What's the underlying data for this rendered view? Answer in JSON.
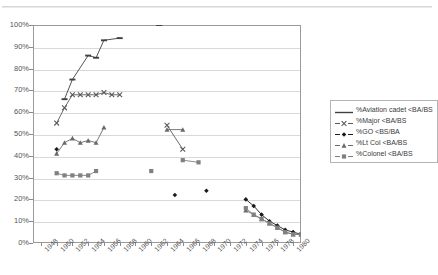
{
  "chart_data": {
    "type": "line",
    "title": "",
    "xlabel": "",
    "ylabel": "",
    "xlim": [
      1947,
      1981
    ],
    "ylim": [
      0,
      1.0
    ],
    "ytick_labels": [
      "0%",
      "10%",
      "20%",
      "30%",
      "40%",
      "50%",
      "60%",
      "70%",
      "80%",
      "90%",
      "100%"
    ],
    "ytick_values": [
      0,
      10,
      20,
      30,
      40,
      50,
      60,
      70,
      80,
      90,
      100
    ],
    "xtick_labels": [
      "1948",
      "1950",
      "1952",
      "1954",
      "1956",
      "1958",
      "1960",
      "1962",
      "1964",
      "1966",
      "1968",
      "1970",
      "1972",
      "1974",
      "1976",
      "1978",
      "1980"
    ],
    "xtick_values": [
      1948,
      1950,
      1952,
      1954,
      1956,
      1958,
      1960,
      1962,
      1964,
      1966,
      1968,
      1970,
      1972,
      1974,
      1976,
      1978,
      1980
    ],
    "grid": "horizontal",
    "legend_position": "right",
    "series": [
      {
        "name": "%Aviation cadet <BA/BS",
        "marker": "dash",
        "color": "#404040",
        "points": [
          {
            "x": 1951,
            "y": 66
          },
          {
            "x": 1952,
            "y": 75
          },
          {
            "x": 1954,
            "y": 86
          },
          {
            "x": 1955,
            "y": 85
          },
          {
            "x": 1956,
            "y": 93
          },
          {
            "x": 1958,
            "y": 94
          },
          {
            "x": 1963,
            "y": 100
          }
        ]
      },
      {
        "name": "%Major <BA/BS",
        "marker": "x",
        "color": "#5a5a5a",
        "points": [
          {
            "x": 1950,
            "y": 55
          },
          {
            "x": 1951,
            "y": 62
          },
          {
            "x": 1952,
            "y": 68
          },
          {
            "x": 1953,
            "y": 68
          },
          {
            "x": 1954,
            "y": 68
          },
          {
            "x": 1955,
            "y": 68
          },
          {
            "x": 1956,
            "y": 69
          },
          {
            "x": 1957,
            "y": 68
          },
          {
            "x": 1958,
            "y": 68
          },
          {
            "x": 1964,
            "y": 54
          },
          {
            "x": 1966,
            "y": 43
          }
        ]
      },
      {
        "name": "%GO <BS/BA",
        "marker": "diamond",
        "color": "#1a1a1a",
        "points": [
          {
            "x": 1950,
            "y": 43
          },
          {
            "x": 1965,
            "y": 22
          },
          {
            "x": 1969,
            "y": 24
          },
          {
            "x": 1974,
            "y": 20
          },
          {
            "x": 1975,
            "y": 17
          },
          {
            "x": 1976,
            "y": 13
          },
          {
            "x": 1977,
            "y": 10
          },
          {
            "x": 1978,
            "y": 8
          },
          {
            "x": 1979,
            "y": 6
          },
          {
            "x": 1980,
            "y": 5
          },
          {
            "x": 1981,
            "y": 4
          }
        ]
      },
      {
        "name": "%Lt Col <BA/BS",
        "marker": "triangle",
        "color": "#6a6a6a",
        "points": [
          {
            "x": 1950,
            "y": 41
          },
          {
            "x": 1951,
            "y": 46
          },
          {
            "x": 1952,
            "y": 48
          },
          {
            "x": 1953,
            "y": 46
          },
          {
            "x": 1954,
            "y": 47
          },
          {
            "x": 1955,
            "y": 46
          },
          {
            "x": 1956,
            "y": 53
          },
          {
            "x": 1964,
            "y": 52
          },
          {
            "x": 1966,
            "y": 52
          },
          {
            "x": 1974,
            "y": 15
          },
          {
            "x": 1975,
            "y": 13
          },
          {
            "x": 1976,
            "y": 11
          },
          {
            "x": 1977,
            "y": 9
          },
          {
            "x": 1978,
            "y": 7
          },
          {
            "x": 1979,
            "y": 5
          },
          {
            "x": 1980,
            "y": 4
          },
          {
            "x": 1981,
            "y": 4
          }
        ]
      },
      {
        "name": "%Colonel <BA/BS",
        "marker": "square",
        "color": "#808080",
        "points": [
          {
            "x": 1950,
            "y": 32
          },
          {
            "x": 1951,
            "y": 31
          },
          {
            "x": 1952,
            "y": 31
          },
          {
            "x": 1953,
            "y": 31
          },
          {
            "x": 1954,
            "y": 31
          },
          {
            "x": 1955,
            "y": 33
          },
          {
            "x": 1962,
            "y": 33
          },
          {
            "x": 1966,
            "y": 38
          },
          {
            "x": 1968,
            "y": 37
          },
          {
            "x": 1974,
            "y": 16
          },
          {
            "x": 1975,
            "y": 13
          },
          {
            "x": 1976,
            "y": 11
          },
          {
            "x": 1977,
            "y": 9
          },
          {
            "x": 1978,
            "y": 7
          },
          {
            "x": 1979,
            "y": 5
          },
          {
            "x": 1980,
            "y": 4
          },
          {
            "x": 1981,
            "y": 4
          }
        ]
      }
    ]
  },
  "legend": {
    "items": [
      {
        "label": "%Aviation cadet <BA/BS"
      },
      {
        "label": "%Major <BA/BS"
      },
      {
        "label": "%GO <BS/BA"
      },
      {
        "label": "%Lt Col <BA/BS"
      },
      {
        "label": "%Colonel <BA/BS"
      }
    ]
  },
  "top_fragment": ""
}
